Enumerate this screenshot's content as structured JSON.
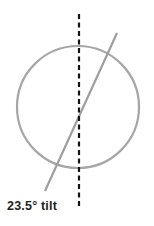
{
  "figure": {
    "kind": "axial-tilt-diagram",
    "width": 154,
    "height": 226,
    "background_color": "#ffffff",
    "label": "23.5° tilt"
  },
  "chart_data": {
    "type": "diagram",
    "title": "23.5° tilt",
    "xlabel": "",
    "ylabel": "",
    "annotations": [
      {
        "name": "tilt-label",
        "text": "23.5° tilt",
        "x": 7,
        "y": 206,
        "color": "#1f1f1f",
        "bold": true
      }
    ],
    "shapes": [
      {
        "name": "planet-circle",
        "type": "circle",
        "cx": 78,
        "cy": 107,
        "r": 61,
        "stroke": "#a6a6a6",
        "stroke_width": 2.2,
        "fill": "none"
      },
      {
        "name": "vertical-reference-line",
        "type": "line",
        "x1": 79,
        "y1": 14,
        "x2": 79,
        "y2": 208,
        "stroke": "#141414",
        "stroke_width": 2.2,
        "dash": "5,3.5"
      },
      {
        "name": "tilted-rotation-axis",
        "type": "line",
        "x1": 117,
        "y1": 33,
        "x2": 45,
        "y2": 191,
        "stroke": "#9e9e9e",
        "stroke_width": 2.2,
        "dash": "none"
      }
    ],
    "measurements": [
      {
        "name": "axial-tilt",
        "value": 23.5,
        "unit": "degrees",
        "description": "angle between the tilted rotation axis and the dashed vertical reference line"
      }
    ],
    "legend": [],
    "grid": false
  },
  "colors": {
    "circle_stroke": "#a6a6a6",
    "axis_stroke": "#9e9e9e",
    "reference_stroke": "#141414",
    "label_text": "#1f1f1f",
    "background": "#ffffff"
  }
}
